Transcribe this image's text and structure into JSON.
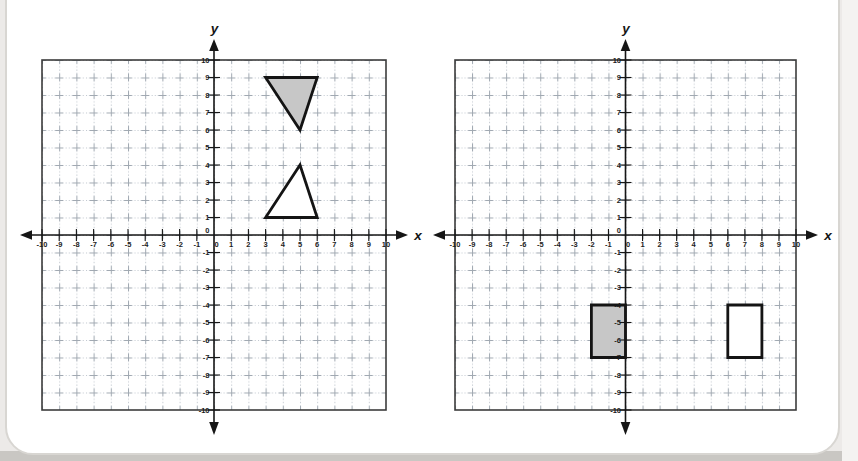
{
  "page": {
    "background": "#eceae8",
    "bottom_edge_color": "#c9c7c3",
    "card_background": "#ffffff",
    "card_border_color": "#d8d6d2"
  },
  "style": {
    "axis_color": "#161616",
    "box_border_color": "#3c3c3c",
    "grid_dot_color": "#bdc4cc",
    "grid_cross_color": "#a0a8b1",
    "label_color": "#1d1d1d",
    "shape_stroke_color": "#141414",
    "shaded_fill": "#c7c7c7",
    "unshaded_fill": "#ffffff"
  },
  "grids": [
    {
      "name": "coordinate-plane-left",
      "axis_title_x": "x",
      "axis_title_y": "y",
      "x_min": -10,
      "x_max": 10,
      "y_min": -10,
      "y_max": 10,
      "x_tick_labels": [
        "-10",
        "-9",
        "-8",
        "-7",
        "-6",
        "-5",
        "-4",
        "-3",
        "-2",
        "-1",
        "0",
        "1",
        "2",
        "3",
        "4",
        "5",
        "6",
        "7",
        "8",
        "9",
        "10"
      ],
      "y_tick_labels": [
        "10",
        "9",
        "8",
        "7",
        "6",
        "5",
        "4",
        "3",
        "2",
        "1",
        "0",
        "-1",
        "-2",
        "-3",
        "-4",
        "-5",
        "-6",
        "-7",
        "-8",
        "-9",
        "-10"
      ],
      "shapes": [
        {
          "name": "shaded-triangle",
          "shaded": true,
          "points": [
            [
              3,
              9
            ],
            [
              6,
              9
            ],
            [
              5,
              6
            ]
          ]
        },
        {
          "name": "outline-triangle",
          "shaded": false,
          "points": [
            [
              3,
              1
            ],
            [
              6,
              1
            ],
            [
              5,
              4
            ]
          ]
        }
      ]
    },
    {
      "name": "coordinate-plane-right",
      "axis_title_x": "x",
      "axis_title_y": "y",
      "x_min": -10,
      "x_max": 10,
      "y_min": -10,
      "y_max": 10,
      "x_tick_labels": [
        "-10",
        "-9",
        "-8",
        "-7",
        "-6",
        "-5",
        "-4",
        "-3",
        "-2",
        "-1",
        "0",
        "1",
        "2",
        "3",
        "4",
        "5",
        "6",
        "7",
        "8",
        "9",
        "10"
      ],
      "y_tick_labels": [
        "10",
        "9",
        "8",
        "7",
        "6",
        "5",
        "4",
        "3",
        "2",
        "1",
        "0",
        "-1",
        "-2",
        "-3",
        "-4",
        "-5",
        "-6",
        "-7",
        "-8",
        "-9",
        "-10"
      ],
      "shapes": [
        {
          "name": "shaded-rectangle",
          "shaded": true,
          "points": [
            [
              -2,
              -4
            ],
            [
              0,
              -4
            ],
            [
              0,
              -7
            ],
            [
              -2,
              -7
            ]
          ]
        },
        {
          "name": "outline-rectangle",
          "shaded": false,
          "points": [
            [
              6,
              -4
            ],
            [
              8,
              -4
            ],
            [
              8,
              -7
            ],
            [
              6,
              -7
            ]
          ]
        }
      ]
    }
  ]
}
